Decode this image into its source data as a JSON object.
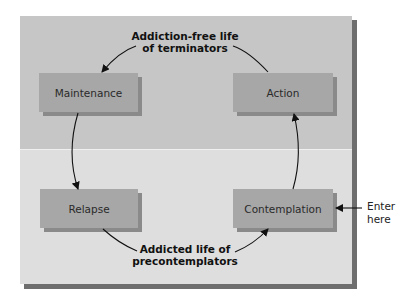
{
  "diagram": {
    "colors": {
      "top_region": "#c6c6c6",
      "bottom_region": "#dedede",
      "box_fill": "#a7a7a7",
      "arrow": "#111111"
    },
    "top_caption": {
      "line1": "Addiction-free life",
      "line2": "of terminators"
    },
    "bottom_caption": {
      "line1": "Addicted life of",
      "line2": "precontemplators"
    },
    "stages": {
      "maintenance": "Maintenance",
      "action": "Action",
      "relapse": "Relapse",
      "contemplation": "Contemplation"
    },
    "entry": {
      "line1": "Enter",
      "line2": "here"
    }
  }
}
